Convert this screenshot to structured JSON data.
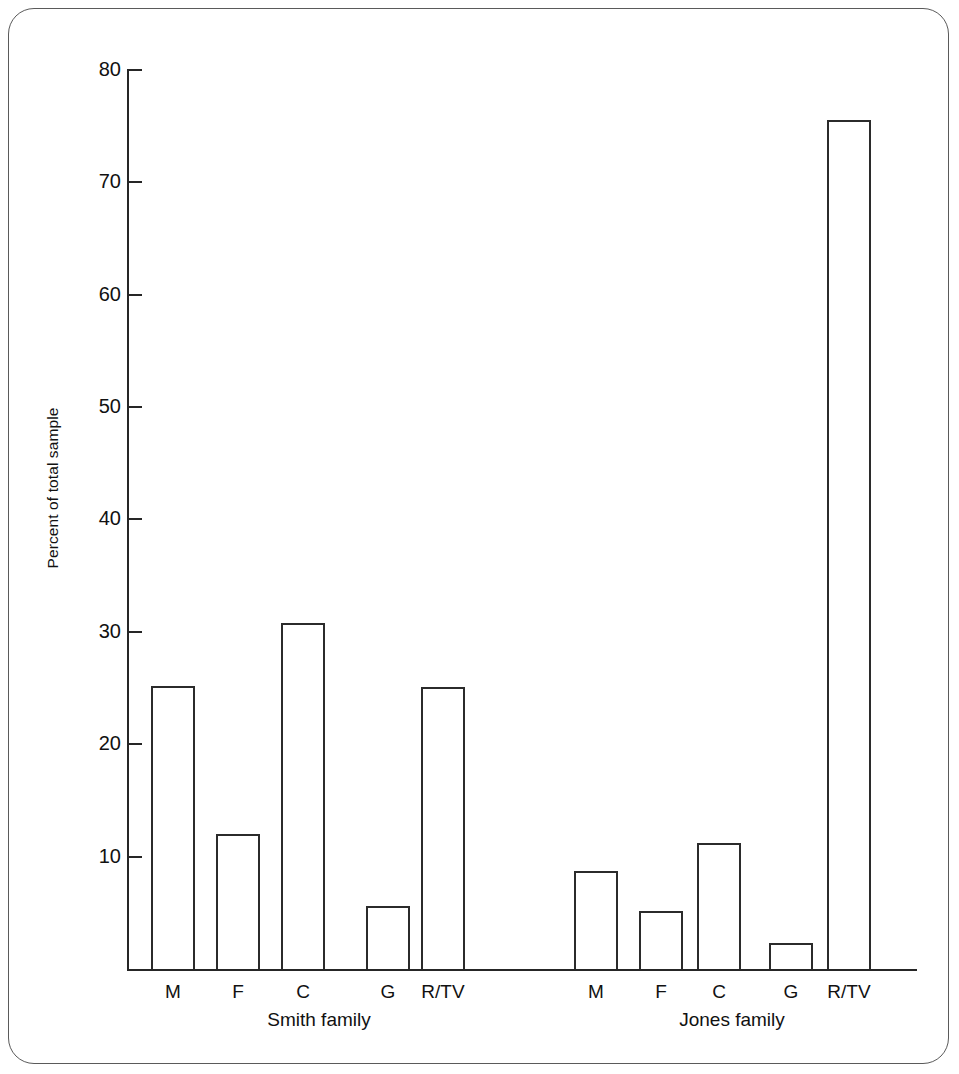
{
  "chart_data": {
    "type": "bar",
    "title": "",
    "xlabel": "",
    "ylabel": "Percent of total sample",
    "ylim": [
      0,
      80
    ],
    "ytick_labels": [
      "80",
      "70",
      "60",
      "50",
      "40",
      "30",
      "20",
      "10"
    ],
    "ytick_values": [
      80,
      70,
      60,
      50,
      40,
      30,
      20,
      10
    ],
    "grid": false,
    "legend": "none",
    "groups": [
      {
        "name": "Smith family",
        "categories": [
          "M",
          "F",
          "C",
          "G",
          "R/TV"
        ],
        "values": [
          25.2,
          12.0,
          30.8,
          5.6,
          25.1
        ]
      },
      {
        "name": "Jones family",
        "categories": [
          "M",
          "F",
          "C",
          "G",
          "R/TV"
        ],
        "values": [
          8.7,
          5.2,
          11.2,
          2.3,
          75.5
        ]
      }
    ]
  },
  "axis": {
    "y_title": "Percent of total sample",
    "ticks": [
      {
        "label": "80",
        "value": 80
      },
      {
        "label": "70",
        "value": 70
      },
      {
        "label": "60",
        "value": 60
      },
      {
        "label": "50",
        "value": 50
      },
      {
        "label": "40",
        "value": 40
      },
      {
        "label": "30",
        "value": 30
      },
      {
        "label": "20",
        "value": 20
      },
      {
        "label": "10",
        "value": 10
      }
    ]
  },
  "bars": [
    {
      "id": "smith-m",
      "group": "Smith family",
      "label": "M",
      "value": 25.2
    },
    {
      "id": "smith-f",
      "group": "Smith family",
      "label": "F",
      "value": 12.0
    },
    {
      "id": "smith-c",
      "group": "Smith family",
      "label": "C",
      "value": 30.8
    },
    {
      "id": "smith-g",
      "group": "Smith family",
      "label": "G",
      "value": 5.6
    },
    {
      "id": "smith-rtv",
      "group": "Smith family",
      "label": "R/TV",
      "value": 25.1
    },
    {
      "id": "jones-m",
      "group": "Jones family",
      "label": "M",
      "value": 8.7
    },
    {
      "id": "jones-f",
      "group": "Jones family",
      "label": "F",
      "value": 5.2
    },
    {
      "id": "jones-c",
      "group": "Jones family",
      "label": "C",
      "value": 11.2
    },
    {
      "id": "jones-g",
      "group": "Jones family",
      "label": "G",
      "value": 2.3
    },
    {
      "id": "jones-rtv",
      "group": "Jones family",
      "label": "R/TV",
      "value": 75.5
    }
  ],
  "group_labels": [
    {
      "id": "smith",
      "text": "Smith family"
    },
    {
      "id": "jones",
      "text": "Jones family"
    }
  ],
  "colors": {
    "bar_stroke": "#2b2b2b",
    "axis": "#262626",
    "frame": "#5a5a5a",
    "text": "#111111",
    "background": "#ffffff"
  }
}
